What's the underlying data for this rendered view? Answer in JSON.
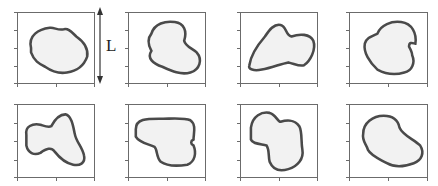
{
  "figure": {
    "scale_label": "L",
    "colors": {
      "frame": "#6b6b6b",
      "outline": "#4a4a4a",
      "fill": "#f2f2f2",
      "arrow": "#333333"
    },
    "panels": [
      {
        "id": 1,
        "row": 1,
        "col": 1,
        "x": 17,
        "y": 12,
        "w": 78,
        "h": 72,
        "path": "M 18 50 C 14 32 28 24 42 22 C 48 21 52 26 60 24 C 66 22 70 28 76 34 C 84 40 92 48 90 62 C 86 74 78 82 64 84 C 54 86 44 82 36 76 C 28 72 22 68 18 56 Z"
      },
      {
        "id": 2,
        "row": 1,
        "col": 2,
        "x": 128,
        "y": 12,
        "w": 78,
        "h": 72,
        "path": "M 30 30 C 34 16 48 12 60 14 C 72 16 76 26 72 40 C 74 48 82 50 88 56 C 96 66 92 80 80 84 C 68 88 56 82 44 76 C 32 72 24 64 30 54 C 26 46 24 38 30 30 Z"
      },
      {
        "id": 3,
        "row": 1,
        "col": 3,
        "x": 240,
        "y": 12,
        "w": 78,
        "h": 72,
        "path": "M 12 74 C 14 58 24 44 32 34 C 38 24 44 16 52 18 C 60 20 58 32 66 34 C 76 30 90 30 94 40 C 98 52 90 68 82 74 C 76 76 70 72 62 70 C 52 72 40 78 28 80 C 18 82 10 80 12 74 Z"
      },
      {
        "id": 4,
        "row": 1,
        "col": 4,
        "x": 349,
        "y": 12,
        "w": 79,
        "h": 72,
        "path": "M 36 30 C 40 18 54 12 66 14 C 80 16 86 30 84 44 C 82 44 76 40 76 48 C 78 52 80 56 80 60 C 84 70 80 82 70 84 C 58 88 46 86 36 80 C 26 70 18 56 20 44 C 22 36 28 34 36 30 Z"
      },
      {
        "id": 5,
        "row": 2,
        "col": 1,
        "x": 17,
        "y": 104,
        "w": 78,
        "h": 74,
        "path": "M 12 42 C 10 30 20 26 30 28 C 36 30 40 32 44 30 C 48 22 54 14 62 14 C 70 16 72 30 74 40 C 76 52 84 58 86 70 C 88 80 80 84 72 82 C 62 80 54 72 48 64 C 44 58 38 60 30 66 C 22 70 14 66 12 56 Z"
      },
      {
        "id": 6,
        "row": 2,
        "col": 2,
        "x": 128,
        "y": 104,
        "w": 78,
        "h": 74,
        "path": "M 10 34 C 10 20 24 20 40 20 C 56 20 72 18 80 22 C 88 28 84 40 84 48 C 80 50 80 54 84 56 C 88 66 86 78 76 82 C 64 84 50 84 42 78 C 36 72 38 62 34 58 C 26 54 14 52 10 44 Z"
      },
      {
        "id": 7,
        "row": 2,
        "col": 3,
        "x": 240,
        "y": 104,
        "w": 78,
        "h": 74,
        "path": "M 14 32 C 16 16 28 10 38 12 C 46 14 48 24 52 24 C 58 22 70 20 76 30 C 80 38 78 50 80 62 C 82 74 74 84 62 88 C 50 92 42 88 38 78 C 36 70 38 62 34 56 C 26 54 16 54 14 48 Z"
      },
      {
        "id": 8,
        "row": 2,
        "col": 4,
        "x": 349,
        "y": 104,
        "w": 79,
        "h": 74,
        "path": "M 18 40 C 18 26 30 16 44 16 C 56 16 62 22 64 32 C 68 42 82 48 90 56 C 96 66 92 76 82 80 C 72 84 58 86 48 80 C 38 74 28 70 24 62 C 22 54 16 50 18 40 Z"
      }
    ],
    "arrow": {
      "x": 100,
      "y_top": 7,
      "y_bottom": 84
    }
  }
}
